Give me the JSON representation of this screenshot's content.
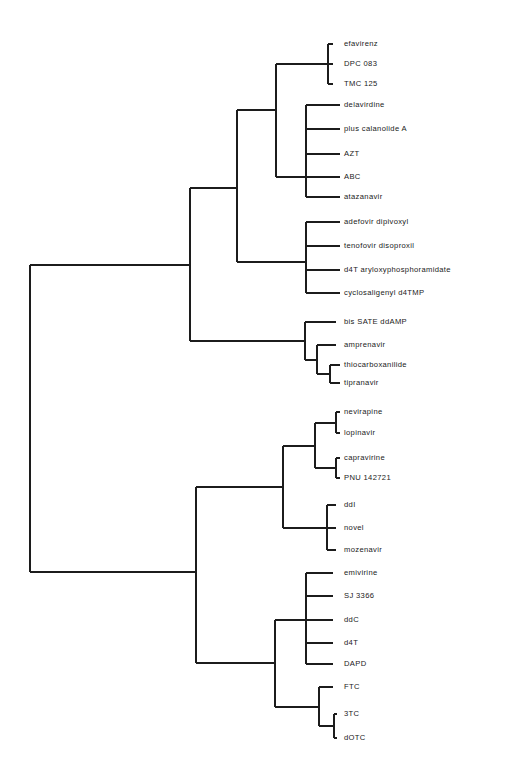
{
  "figure": {
    "type": "dendrogram",
    "title": "",
    "orientation": "left-to-right",
    "background_color": "#ffffff",
    "line_color": "#1c1c1c",
    "label_color": "#1a1a1a"
  },
  "chart_data": {
    "type": "tree",
    "title": "",
    "xlabel": "",
    "ylabel": "",
    "grid": false,
    "legend": "none",
    "leaf_count": 29,
    "leaves": [
      {
        "id": "efavirenz",
        "label": "efavirenz",
        "y": 44,
        "tip_x": 333
      },
      {
        "id": "dpc-083",
        "label": "DPC 083",
        "y": 64,
        "tip_x": 333
      },
      {
        "id": "tmc-125",
        "label": "TMC 125",
        "y": 84,
        "tip_x": 333
      },
      {
        "id": "delavirdine",
        "label": "delavirdine",
        "y": 105,
        "tip_x": 340
      },
      {
        "id": "plus-calanolide-a",
        "label": "plus calanolide A",
        "y": 129,
        "tip_x": 340
      },
      {
        "id": "azt",
        "label": "AZT",
        "y": 154,
        "tip_x": 340
      },
      {
        "id": "abc",
        "label": "ABC",
        "y": 177,
        "tip_x": 340
      },
      {
        "id": "atazanavir",
        "label": "atazanavir",
        "y": 197,
        "tip_x": 340
      },
      {
        "id": "adefovir-dipivoxyl",
        "label": "adefovir dipivoxyl",
        "y": 222,
        "tip_x": 340
      },
      {
        "id": "tenofovir-disoproxil",
        "label": "tenofovir disoproxil",
        "y": 246,
        "tip_x": 340
      },
      {
        "id": "d4t-aryloxyphosphoramidate",
        "label": "d4T aryloxyphosphoramidate",
        "y": 270,
        "tip_x": 340
      },
      {
        "id": "cyclosaligenyl-d4tmp",
        "label": "cyclosaligenyl d4TMP",
        "y": 293,
        "tip_x": 340
      },
      {
        "id": "bis-sate-ddamp",
        "label": "bis SATE ddAMP",
        "y": 322,
        "tip_x": 336
      },
      {
        "id": "amprenavir",
        "label": "amprenavir",
        "y": 345,
        "tip_x": 336
      },
      {
        "id": "thiocarboxanilide",
        "label": "thiocarboxanilide",
        "y": 365,
        "tip_x": 340
      },
      {
        "id": "tipranavir",
        "label": "tipranavir",
        "y": 383,
        "tip_x": 340
      },
      {
        "id": "nevirapine",
        "label": "nevirapine",
        "y": 412,
        "tip_x": 340
      },
      {
        "id": "lopinavir",
        "label": "lopinavir",
        "y": 433,
        "tip_x": 340
      },
      {
        "id": "capravirine",
        "label": "capravirine",
        "y": 458,
        "tip_x": 340
      },
      {
        "id": "pnu-142721",
        "label": "PNU 142721",
        "y": 478,
        "tip_x": 340
      },
      {
        "id": "ddi",
        "label": "ddI",
        "y": 505,
        "tip_x": 336
      },
      {
        "id": "novel",
        "label": "novel",
        "y": 528,
        "tip_x": 336
      },
      {
        "id": "mozenavir",
        "label": "mozenavir",
        "y": 550,
        "tip_x": 336
      },
      {
        "id": "emivirine",
        "label": "emivirine",
        "y": 573,
        "tip_x": 333
      },
      {
        "id": "sj-3366",
        "label": "SJ 3366",
        "y": 596,
        "tip_x": 333
      },
      {
        "id": "ddc",
        "label": "ddC",
        "y": 620,
        "tip_x": 333
      },
      {
        "id": "d4t",
        "label": "d4T",
        "y": 643,
        "tip_x": 333
      },
      {
        "id": "dapd",
        "label": "DAPD",
        "y": 664,
        "tip_x": 333
      },
      {
        "id": "ftc",
        "label": "FTC",
        "y": 687,
        "tip_x": 333
      },
      {
        "id": "3tc",
        "label": "3TC",
        "y": 714,
        "tip_x": 337
      },
      {
        "id": "dotc",
        "label": "dOTC",
        "y": 738,
        "tip_x": 337
      }
    ],
    "label_x": 344,
    "nodes": [
      {
        "id": "n-efav-dpc",
        "x": 328,
        "y_top": 44,
        "y_bottom": 84,
        "parent_x": 276,
        "y": 64
      },
      {
        "id": "n-nnrti-upper",
        "x": 276,
        "y_top": 64,
        "y_bottom": 177,
        "parent_x": 237,
        "y": 110
      },
      {
        "id": "n-delav-group",
        "x": 306,
        "y_top": 105,
        "y_bottom": 197,
        "parent_x": 276,
        "y": 177
      },
      {
        "id": "n-adefovir",
        "x": 306,
        "y_top": 222,
        "y_bottom": 293,
        "parent_x": 237,
        "y": 262
      },
      {
        "id": "n-mid-upper",
        "x": 237,
        "y_top": 110,
        "y_bottom": 262,
        "parent_x": 190,
        "y": 188
      },
      {
        "id": "n-thio-tipra",
        "x": 330,
        "y_top": 365,
        "y_bottom": 383,
        "parent_x": 317,
        "y": 374
      },
      {
        "id": "n-ampren",
        "x": 317,
        "y_top": 345,
        "y_bottom": 374,
        "parent_x": 305,
        "y": 360
      },
      {
        "id": "n-bissate",
        "x": 305,
        "y_top": 322,
        "y_bottom": 360,
        "parent_x": 190,
        "y": 341
      },
      {
        "id": "n-top-half",
        "x": 190,
        "y_top": 188,
        "y_bottom": 341,
        "parent_x": 30,
        "y": 265
      },
      {
        "id": "n-nevi-lopi",
        "x": 336,
        "y_top": 412,
        "y_bottom": 433,
        "parent_x": 315,
        "y": 423
      },
      {
        "id": "n-capra-pnu",
        "x": 336,
        "y_top": 458,
        "y_bottom": 478,
        "parent_x": 315,
        "y": 468
      },
      {
        "id": "n-nnrti-lower",
        "x": 315,
        "y_top": 423,
        "y_bottom": 468,
        "parent_x": 283,
        "y": 446
      },
      {
        "id": "n-ddi-novel",
        "x": 327,
        "y_top": 505,
        "y_bottom": 550,
        "parent_x": 283,
        "y": 528
      },
      {
        "id": "n-lower-a",
        "x": 283,
        "y_top": 446,
        "y_bottom": 528,
        "parent_x": 196,
        "y": 487
      },
      {
        "id": "n-emivirine",
        "x": 306,
        "y_top": 573,
        "y_bottom": 664,
        "parent_x": 275,
        "y": 620
      },
      {
        "id": "n-3tc-dotc",
        "x": 334,
        "y_top": 714,
        "y_bottom": 738,
        "parent_x": 319,
        "y": 726
      },
      {
        "id": "n-ftc",
        "x": 319,
        "y_top": 687,
        "y_bottom": 726,
        "parent_x": 275,
        "y": 707
      },
      {
        "id": "n-lower-b",
        "x": 275,
        "y_top": 620,
        "y_bottom": 707,
        "parent_x": 196,
        "y": 663
      },
      {
        "id": "n-bottom-half",
        "x": 196,
        "y_top": 487,
        "y_bottom": 663,
        "parent_x": 30,
        "y": 572
      },
      {
        "id": "n-root",
        "x": 30,
        "y_top": 265,
        "y_bottom": 572,
        "parent_x": null,
        "y": 418
      }
    ]
  }
}
